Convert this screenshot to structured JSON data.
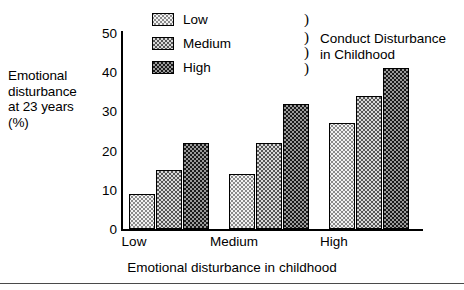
{
  "chart_data": {
    "type": "bar",
    "title": "",
    "categories": [
      "Low",
      "Medium",
      "High"
    ],
    "series": [
      {
        "name": "Low",
        "values": [
          9,
          14,
          27
        ]
      },
      {
        "name": "Medium",
        "values": [
          15,
          22,
          34
        ]
      },
      {
        "name": "High",
        "values": [
          22,
          32,
          41
        ]
      }
    ],
    "xlabel": "Emotional disturbance in childhood",
    "ylabel": "Emotional disturbance at 23 years (%)",
    "ylim": [
      0,
      50
    ],
    "yticks": [
      0,
      10,
      20,
      30,
      40,
      50
    ],
    "ytick_labels": [
      "0",
      "10",
      "20",
      "30",
      "40",
      "50"
    ],
    "grid": false,
    "legend_position": "top-center",
    "legend_title": "Conduct Disturbance in Childhood"
  },
  "axes": {
    "y_title_lines": [
      "Emotional",
      "disturbance",
      "at 23 years",
      "(%)"
    ],
    "x_title": "Emotional disturbance in childhood",
    "y_ticks": [
      "50",
      "40",
      "30",
      "20",
      "10",
      "0"
    ],
    "x_ticks": [
      "Low",
      "Medium",
      "High"
    ]
  },
  "legend": {
    "items": [
      {
        "label": "Low",
        "pattern": "light-dotted"
      },
      {
        "label": "Medium",
        "pattern": "medium-checker"
      },
      {
        "label": "High",
        "pattern": "dark-dense"
      }
    ],
    "brace_glyph": ")",
    "group_title_lines": [
      "Conduct Disturbance",
      "in Childhood"
    ]
  },
  "colors": {
    "axis": "#000000",
    "text": "#000000",
    "background": "#ffffff",
    "low_fill": "#f2f2f2",
    "medium_fill": "#d8d8d8",
    "high_fill": "#1a1a1a"
  }
}
